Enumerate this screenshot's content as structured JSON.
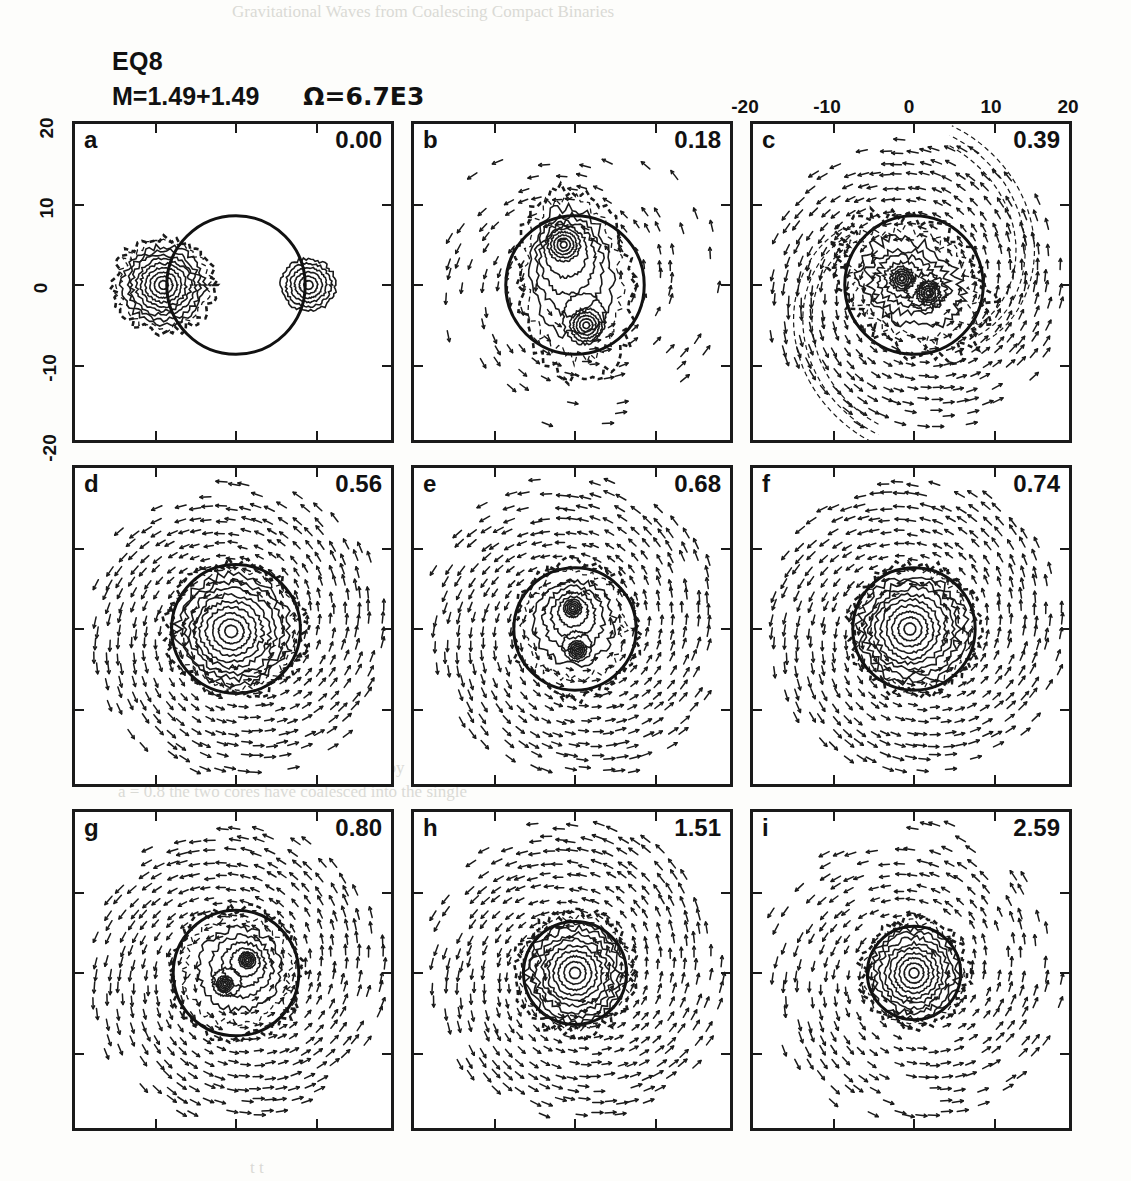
{
  "figure": {
    "title": "EQ8",
    "params_mass": "M=1.49+1.49",
    "params_omega": "Ω=6.7E3"
  },
  "axes": {
    "top_ticks": [
      "-20",
      "-10",
      "0",
      "10",
      "20"
    ],
    "left_ticks": [
      "20",
      "10",
      "0",
      "-10",
      "-20"
    ],
    "xlim": [
      -20,
      20
    ],
    "ylim": [
      -20,
      20
    ]
  },
  "bleed_text": [
    "Gravitational Waves from Coalescing Compact Binaries",
    "3 5",
    "a",
    "e",
    "components, for the separation",
    "the gravitational",
    "momentum away from the system by",
    "a = 0.8 the two cores have coalesced into the single",
    "the corresponding long",
    "low amplitude",
    "t t"
  ],
  "chart_data": {
    "type": "contour",
    "title": "EQ8",
    "subtitle": "M=1.49+1.49   Ω=6.7E3",
    "xlabel": "",
    "ylabel": "",
    "xlim": [
      -20,
      20
    ],
    "ylim": [
      -20,
      20
    ],
    "grid": false,
    "legend": "none",
    "panel_count": 9,
    "panel_layout": [
      3,
      3
    ],
    "panels": [
      {
        "label": "a",
        "time": "0.00",
        "t": 0.0,
        "structure": "two detached equal-mass stars",
        "cores": [
          [
            -9.0,
            0.0
          ],
          [
            9.0,
            0.0
          ]
        ],
        "core_radius": 6.2,
        "ref_circle": {
          "cx": 0.0,
          "cy": 0.0,
          "r": 8.6
        },
        "vectors": "minimal"
      },
      {
        "label": "b",
        "time": "0.18",
        "t": 0.18,
        "structure": "vertically elongated contact binary, two cores",
        "cores": [
          [
            -1.4,
            5.0
          ],
          [
            1.4,
            -5.0
          ]
        ],
        "core_radius": 4.4,
        "ref_circle": {
          "cx": 0.0,
          "cy": 0.0,
          "r": 8.6
        },
        "envelope": {
          "a": 7.0,
          "b": 12.4,
          "angle": 8
        },
        "vectors": "light"
      },
      {
        "label": "c",
        "time": "0.39",
        "t": 0.39,
        "structure": "rotated bar with trailing spiral arms",
        "cores": [
          [
            -1.5,
            0.8
          ],
          [
            1.8,
            -1.0
          ]
        ],
        "core_radius": 3.2,
        "ref_circle": {
          "cx": 0.0,
          "cy": 0.0,
          "r": 8.6
        },
        "envelope": {
          "a": 10.5,
          "b": 7.6,
          "angle": -38
        },
        "spiral_arms": 2,
        "vectors": "strong"
      },
      {
        "label": "d",
        "time": "0.56",
        "t": 0.56,
        "structure": "nearly round remnant with weak spiral arms",
        "cores": [
          [
            -0.6,
            -0.3
          ]
        ],
        "core_radius": 3.0,
        "ref_circle": {
          "cx": 0.0,
          "cy": 0.0,
          "r": 8.0
        },
        "envelope": {
          "a": 8.6,
          "b": 8.2,
          "angle": -20
        },
        "vectors": "strong"
      },
      {
        "label": "e",
        "time": "0.68",
        "t": 0.68,
        "structure": "double-core remnant, vertical axis",
        "cores": [
          [
            -0.3,
            2.6
          ],
          [
            0.3,
            -2.6
          ]
        ],
        "core_radius": 2.4,
        "ref_circle": {
          "cx": 0.0,
          "cy": 0.0,
          "r": 7.6
        },
        "envelope": {
          "a": 7.8,
          "b": 8.4,
          "angle": 0
        },
        "vectors": "strong"
      },
      {
        "label": "f",
        "time": "0.74",
        "t": 0.74,
        "structure": "single distorted core",
        "cores": [
          [
            -0.5,
            0.0
          ]
        ],
        "core_radius": 2.6,
        "ref_circle": {
          "cx": 0.0,
          "cy": 0.0,
          "r": 7.6
        },
        "envelope": {
          "a": 8.0,
          "b": 8.0,
          "angle": -15
        },
        "vectors": "strong"
      },
      {
        "label": "g",
        "time": "0.80",
        "t": 0.8,
        "structure": "merged core with residual two-lobe centre",
        "cores": [
          [
            1.4,
            1.6
          ],
          [
            -1.4,
            -1.4
          ]
        ],
        "core_radius": 2.2,
        "ref_circle": {
          "cx": 0.0,
          "cy": 0.0,
          "r": 7.8
        },
        "envelope": {
          "a": 8.2,
          "b": 8.2,
          "angle": -25
        },
        "vectors": "strong"
      },
      {
        "label": "h",
        "time": "1.51",
        "t": 1.51,
        "structure": "axisymmetric merged remnant",
        "cores": [
          [
            0.0,
            0.0
          ]
        ],
        "core_radius": 2.0,
        "ref_circle": {
          "cx": 0.0,
          "cy": 0.0,
          "r": 6.4
        },
        "envelope": {
          "a": 7.4,
          "b": 7.6,
          "angle": 0
        },
        "vectors": "strong"
      },
      {
        "label": "i",
        "time": "2.59",
        "t": 2.59,
        "structure": "compact axisymmetric remnant",
        "cores": [
          [
            0.0,
            0.0
          ]
        ],
        "core_radius": 1.8,
        "ref_circle": {
          "cx": 0.0,
          "cy": 0.0,
          "r": 5.8
        },
        "envelope": {
          "a": 6.6,
          "b": 6.8,
          "angle": 0
        },
        "vectors": "moderate"
      }
    ]
  }
}
